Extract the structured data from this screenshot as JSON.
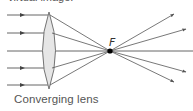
{
  "header": {
    "cut_off_text": "virtual image."
  },
  "diagram": {
    "focal_label": "F",
    "caption": "Converging lens",
    "colors": {
      "ray": "#555555",
      "lens_fill": "#e6e6e6",
      "lens_stroke": "#666666",
      "focal_point": "#000000"
    },
    "incoming_rays_y": [
      15,
      33,
      51,
      68,
      85
    ],
    "focal_point": {
      "x": 110,
      "y": 51
    }
  }
}
